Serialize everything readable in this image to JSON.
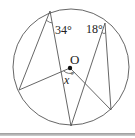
{
  "diagram": {
    "type": "circle-geometry",
    "circle": {
      "cx": 71,
      "cy": 67,
      "r": 58
    },
    "center": {
      "label": "O",
      "x": 70,
      "y": 68
    },
    "points": {
      "A": {
        "x": 50,
        "y": 11
      },
      "B": {
        "x": 105,
        "y": 23
      },
      "C": {
        "x": 19,
        "y": 90
      },
      "D": {
        "x": 71,
        "y": 126
      },
      "E": {
        "x": 111,
        "y": 110
      }
    },
    "segments": [
      [
        "A",
        "C"
      ],
      [
        "A",
        "D"
      ],
      [
        "C",
        "O"
      ],
      [
        "O",
        "E"
      ],
      [
        "B",
        "D"
      ],
      [
        "B",
        "E"
      ]
    ],
    "angles": [
      {
        "label": "34°",
        "vertex": "A",
        "known": true
      },
      {
        "label": "18°",
        "vertex": "B",
        "known": true
      },
      {
        "label": "x°",
        "vertex": "O",
        "known": false
      }
    ],
    "labels": {
      "angle_a": "34°",
      "angle_b": "18°",
      "center": "O",
      "unknown": "x",
      "unknown_deg": "°"
    },
    "colors": {
      "stroke": "#555555",
      "text": "#222222",
      "background": "#ffffff"
    }
  }
}
